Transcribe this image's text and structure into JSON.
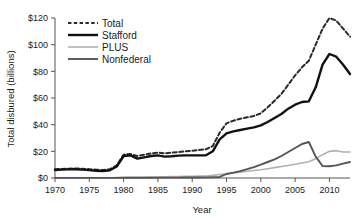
{
  "chart_data": {
    "type": "line",
    "title": "",
    "xlabel": "Year",
    "ylabel": "Total disbured (billions)",
    "xlim": [
      1970,
      2013
    ],
    "ylim": [
      0,
      120
    ],
    "xticks": [
      1970,
      1975,
      1980,
      1985,
      1990,
      1995,
      2000,
      2005,
      2010
    ],
    "xtick_labels": [
      "1970",
      "1975",
      "1980",
      "1985",
      "1990",
      "1995",
      "2000",
      "2005",
      "2010"
    ],
    "yticks": [
      0,
      20,
      40,
      60,
      80,
      100,
      120
    ],
    "ytick_labels": [
      "$0",
      "$20",
      "$40",
      "$60",
      "$80",
      "$100",
      "$120"
    ],
    "grid": false,
    "legend_position": "top-left",
    "x": [
      1970,
      1971,
      1972,
      1973,
      1974,
      1975,
      1976,
      1977,
      1978,
      1979,
      1980,
      1981,
      1982,
      1983,
      1984,
      1985,
      1986,
      1987,
      1988,
      1989,
      1990,
      1991,
      1992,
      1993,
      1994,
      1995,
      1996,
      1997,
      1998,
      1999,
      2000,
      2001,
      2002,
      2003,
      2004,
      2005,
      2006,
      2007,
      2008,
      2009,
      2010,
      2011,
      2012,
      2013
    ],
    "series": [
      {
        "name": "Total",
        "style": "dashed",
        "color": "#2b2b2b",
        "width": 2.0,
        "values": [
          6.5,
          6.8,
          7.0,
          7.2,
          7.0,
          6.6,
          6.2,
          6.0,
          6.6,
          9.5,
          17.5,
          18.0,
          16.5,
          17.5,
          18.5,
          19.0,
          18.5,
          19.0,
          19.5,
          20.0,
          20.5,
          21.0,
          21.5,
          24.0,
          34.0,
          41.0,
          43.0,
          44.5,
          45.5,
          46.5,
          48.5,
          53.0,
          58.0,
          63.0,
          70.0,
          77.0,
          83.0,
          88.0,
          100.0,
          112.0,
          120.0,
          118.0,
          112.0,
          106.0
        ]
      },
      {
        "name": "Stafford",
        "style": "solid",
        "color": "#111111",
        "width": 2.4,
        "values": [
          6.0,
          6.3,
          6.5,
          6.6,
          6.3,
          5.9,
          5.4,
          5.2,
          5.8,
          8.6,
          16.5,
          17.0,
          14.5,
          15.5,
          16.5,
          17.0,
          16.0,
          16.3,
          16.8,
          17.0,
          17.0,
          17.0,
          17.0,
          20.0,
          29.0,
          33.5,
          35.0,
          36.0,
          37.0,
          38.0,
          39.5,
          42.0,
          45.0,
          48.0,
          52.0,
          55.0,
          57.0,
          57.5,
          68.0,
          85.0,
          93.0,
          91.0,
          85.0,
          78.0
        ]
      },
      {
        "name": "PLUS",
        "style": "solid",
        "color": "#b0b0b0",
        "width": 1.6,
        "values": [
          0.2,
          0.2,
          0.2,
          0.2,
          0.2,
          0.2,
          0.2,
          0.2,
          0.2,
          0.3,
          0.4,
          0.5,
          0.5,
          0.6,
          0.7,
          0.8,
          0.9,
          1.0,
          1.1,
          1.2,
          1.3,
          1.4,
          1.5,
          2.0,
          2.6,
          3.2,
          3.8,
          4.4,
          5.0,
          5.6,
          6.2,
          7.0,
          7.8,
          8.6,
          9.4,
          10.3,
          11.2,
          12.2,
          14.5,
          17.5,
          20.0,
          20.5,
          19.5,
          19.5
        ]
      },
      {
        "name": "Nonfederal",
        "style": "solid",
        "color": "#555555",
        "width": 1.9,
        "values": [
          0.1,
          0.1,
          0.1,
          0.1,
          0.1,
          0.1,
          0.1,
          0.1,
          0.1,
          0.1,
          0.2,
          0.2,
          0.2,
          0.2,
          0.2,
          0.3,
          0.3,
          0.3,
          0.3,
          0.4,
          0.4,
          0.4,
          0.5,
          0.6,
          0.8,
          3.0,
          4.0,
          5.2,
          6.6,
          8.2,
          10.0,
          12.0,
          14.0,
          16.5,
          19.5,
          22.5,
          25.5,
          27.0,
          16.0,
          9.0,
          8.8,
          9.5,
          10.8,
          12.0
        ]
      }
    ]
  },
  "legend": {
    "items": [
      {
        "label": "Total"
      },
      {
        "label": "Stafford"
      },
      {
        "label": "PLUS"
      },
      {
        "label": "Nonfederal"
      }
    ]
  }
}
